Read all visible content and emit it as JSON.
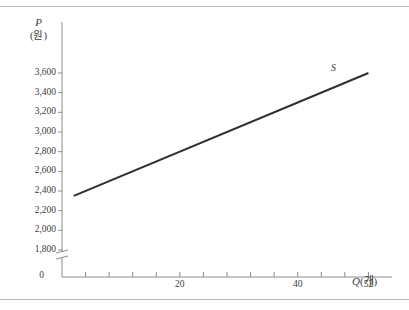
{
  "chart_data": {
    "type": "line",
    "title": "",
    "xlabel": "Q(개)",
    "ylabel": "P(원)",
    "ylabel_symbol": "P",
    "ylabel_unit": "(원)",
    "xlabel_symbol": "Q",
    "xlabel_unit": "(개)",
    "origin_label": "0",
    "axis_break": true,
    "grid": false,
    "legend": "none",
    "xlim": [
      0,
      56
    ],
    "ylim": [
      1700,
      3700
    ],
    "y_ticks": [
      1800,
      2000,
      2200,
      2400,
      2600,
      2800,
      3000,
      3200,
      3400,
      3600
    ],
    "y_tick_labels": [
      "1,800",
      "2,000",
      "2,200",
      "2,400",
      "2,600",
      "2,800",
      "3,000",
      "3,200",
      "3,400",
      "3,600"
    ],
    "x_ticks": [
      4,
      8,
      12,
      16,
      20,
      24,
      28,
      32,
      36,
      40,
      44,
      48,
      52
    ],
    "x_tick_labels": [
      {
        "value": 20,
        "label": "20"
      },
      {
        "value": 40,
        "label": "40"
      },
      {
        "value": 52,
        "label": "52"
      }
    ],
    "series": [
      {
        "name": "S",
        "annotation": "S",
        "color": "#2f2f2f",
        "x": [
          2,
          52
        ],
        "y": [
          2350,
          3600
        ],
        "points": [
          {
            "q": 2,
            "p": 2350
          },
          {
            "q": 52,
            "p": 3600
          }
        ]
      }
    ]
  }
}
